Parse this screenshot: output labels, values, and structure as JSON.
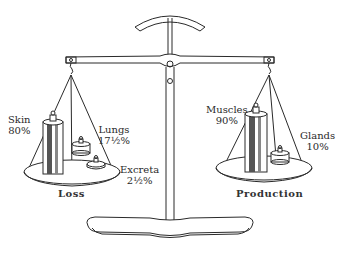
{
  "diagram": {
    "type": "balance-scale",
    "colors": {
      "ink": "#2a2a2a",
      "paper": "#ffffff"
    },
    "left_pan": {
      "title": "Loss",
      "items": [
        {
          "name": "Skin",
          "value": "80%"
        },
        {
          "name": "Lungs",
          "value": "17½%"
        },
        {
          "name": "Excreta",
          "value": "2½%"
        }
      ]
    },
    "right_pan": {
      "title": "Production",
      "items": [
        {
          "name": "Muscles",
          "value": "90%"
        },
        {
          "name": "Glands",
          "value": "10%"
        }
      ]
    }
  }
}
